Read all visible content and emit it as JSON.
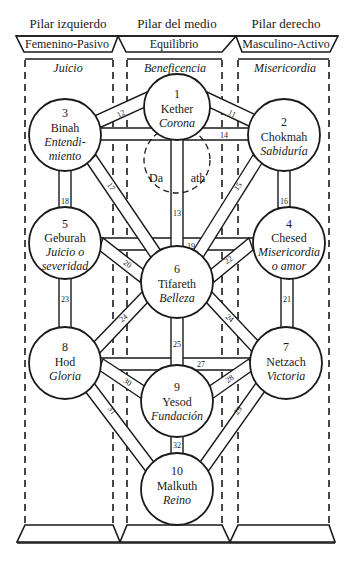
{
  "pillars": {
    "left": {
      "title": "Pilar izquierdo",
      "quality": "Femenino-Pasivo",
      "attribute": "Juicio"
    },
    "middle": {
      "title": "Pilar del medio",
      "quality": "Equilibrio",
      "attribute": "Beneficencia"
    },
    "right": {
      "title": "Pilar derecho",
      "quality": "Masculino-Activo",
      "attribute": "Misericordia"
    }
  },
  "sephiroth": [
    {
      "n": "1",
      "name": "Kether",
      "meaning1": "Corona"
    },
    {
      "n": "2",
      "name": "Chokmah",
      "meaning1": "Sabiduría"
    },
    {
      "n": "3",
      "name": "Binah",
      "meaning1": "Entendi-",
      "meaning2": "miento"
    },
    {
      "n": "4",
      "name": "Chesed",
      "meaning1": "Misericordia",
      "meaning2": "o amor"
    },
    {
      "n": "5",
      "name": "Geburah",
      "meaning1": "Juicio o",
      "meaning2": "severidad"
    },
    {
      "n": "6",
      "name": "Tifareth",
      "meaning1": "Belleza"
    },
    {
      "n": "7",
      "name": "Netzach",
      "meaning1": "Victoria"
    },
    {
      "n": "8",
      "name": "Hod",
      "meaning1": "Gloria"
    },
    {
      "n": "9",
      "name": "Yesod",
      "meaning1": "Fundación"
    },
    {
      "n": "10",
      "name": "Malkuth",
      "meaning1": "Reino"
    }
  ],
  "daath": {
    "left": "Da",
    "right": "ath"
  },
  "paths": [
    "11",
    "12",
    "13",
    "14",
    "15",
    "16",
    "17",
    "18",
    "19",
    "20",
    "21",
    "22",
    "23",
    "24",
    "25",
    "26",
    "27",
    "28",
    "29",
    "30",
    "31",
    "32"
  ]
}
